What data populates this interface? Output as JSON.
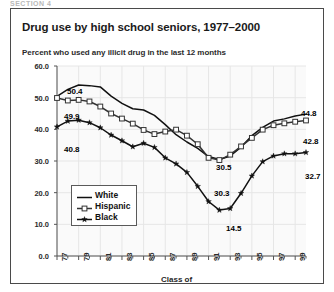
{
  "top_strip_text": "SECTION 4",
  "card": {
    "title": "Drug use by high school seniors, 1977–2000",
    "subtitle": "Percent who used any illicit drug in the last 12 months"
  },
  "legend": {
    "position": "inside-lower-left",
    "items": [
      {
        "label": "White",
        "symbol": "solid-line",
        "color": "#111111"
      },
      {
        "label": "Hispanic",
        "symbol": "open-square-marker",
        "color": "#333333"
      },
      {
        "label": "Black",
        "symbol": "filled-star-marker",
        "color": "#111111"
      }
    ]
  },
  "annotations": [
    {
      "id": "white-start",
      "text": "50.4",
      "series": "White",
      "x": 1977,
      "value": 50.4,
      "left": 56,
      "top": 78
    },
    {
      "id": "hispanic-start",
      "text": "49.9",
      "series": "Hispanic",
      "x": 1977,
      "value": 49.9,
      "left": 53,
      "top": 103
    },
    {
      "id": "black-start",
      "text": "40.8",
      "series": "Black",
      "x": 1977,
      "value": 40.8,
      "left": 53,
      "top": 136
    },
    {
      "id": "white-min",
      "text": "30.5",
      "series": "White",
      "x": 1992,
      "value": 30.5,
      "left": 205,
      "top": 154
    },
    {
      "id": "hispanic-min",
      "text": "30.3",
      "series": "Hispanic",
      "x": 1992,
      "value": 30.3,
      "left": 203,
      "top": 180
    },
    {
      "id": "black-min",
      "text": "14.5",
      "series": "Black",
      "x": 1992,
      "value": 14.5,
      "left": 215,
      "top": 215
    },
    {
      "id": "white-end",
      "text": "44.8",
      "series": "White",
      "x": 2000,
      "value": 44.8,
      "left": 290,
      "top": 100
    },
    {
      "id": "hispanic-end",
      "text": "42.8",
      "series": "Hispanic",
      "x": 2000,
      "value": 42.8,
      "left": 292,
      "top": 128
    },
    {
      "id": "black-end",
      "text": "32.7",
      "series": "Black",
      "x": 2000,
      "value": 32.7,
      "left": 294,
      "top": 163
    }
  ],
  "chart_data": {
    "type": "line",
    "title": "Drug use by high school seniors, 1977–2000",
    "subtitle": "Percent who used any illicit drug in the last 12 months",
    "xlabel": "Class of",
    "ylabel": "",
    "ylim": [
      0.0,
      60.0
    ],
    "yticks": [
      "0.0",
      "10.0",
      "20.0",
      "30.0",
      "40.0",
      "50.0",
      "60.0"
    ],
    "ytick_values": [
      0.0,
      10.0,
      20.0,
      30.0,
      40.0,
      50.0,
      60.0
    ],
    "xlim": [
      1977,
      2000
    ],
    "xticks": [
      "77",
      "79",
      "81",
      "83",
      "85",
      "87",
      "89",
      "91",
      "93",
      "95",
      "97",
      "99"
    ],
    "xtick_values": [
      1977,
      1979,
      1981,
      1983,
      1985,
      1987,
      1989,
      1991,
      1993,
      1995,
      1997,
      1999
    ],
    "x": [
      1977,
      1978,
      1979,
      1980,
      1981,
      1982,
      1983,
      1984,
      1985,
      1986,
      1987,
      1988,
      1989,
      1990,
      1991,
      1992,
      1993,
      1994,
      1995,
      1996,
      1997,
      1998,
      1999,
      2000
    ],
    "grid": true,
    "legend_position": "lower left inside",
    "series": [
      {
        "name": "White",
        "marker": "none",
        "color": "#111111",
        "values": [
          50.4,
          52.6,
          54.0,
          53.8,
          53.4,
          50.5,
          48.2,
          46.5,
          46.1,
          44.4,
          41.5,
          38.3,
          36.0,
          34.0,
          31.4,
          30.5,
          31.6,
          34.4,
          38.0,
          40.6,
          42.6,
          43.3,
          44.2,
          44.8
        ]
      },
      {
        "name": "Hispanic",
        "marker": "open-square",
        "color": "#333333",
        "values": [
          49.9,
          49.1,
          49.3,
          48.8,
          47.2,
          45.0,
          43.4,
          41.8,
          39.8,
          38.5,
          39.3,
          39.9,
          38.0,
          35.3,
          31.0,
          30.3,
          32.0,
          34.6,
          37.3,
          39.9,
          41.3,
          41.9,
          42.4,
          42.8
        ]
      },
      {
        "name": "Black",
        "marker": "filled-star",
        "color": "#111111",
        "values": [
          40.8,
          42.6,
          42.9,
          42.1,
          40.5,
          38.2,
          36.4,
          34.5,
          35.6,
          34.3,
          31.0,
          29.1,
          26.4,
          22.0,
          17.2,
          14.5,
          15.0,
          19.8,
          25.3,
          29.8,
          31.6,
          32.3,
          32.3,
          32.7
        ]
      }
    ]
  }
}
